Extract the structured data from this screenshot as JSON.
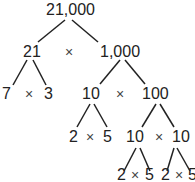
{
  "tree": {
    "root": "21,000",
    "level1": {
      "left": "21",
      "op": "×",
      "right": "1,000"
    },
    "level2": {
      "a": "7",
      "op_a": "×",
      "b": "3",
      "c": "10",
      "op_c": "×",
      "d": "100"
    },
    "level3": {
      "a": "2",
      "op_a": "×",
      "b": "5",
      "c": "10",
      "op_c": "×",
      "d": "10"
    },
    "level4": {
      "a": "2",
      "op_a": "×",
      "b": "5",
      "c": "2",
      "op_c": "×",
      "d": "5"
    }
  },
  "colors": {
    "text": "#222222",
    "line": "#222222",
    "background": "#ffffff"
  }
}
